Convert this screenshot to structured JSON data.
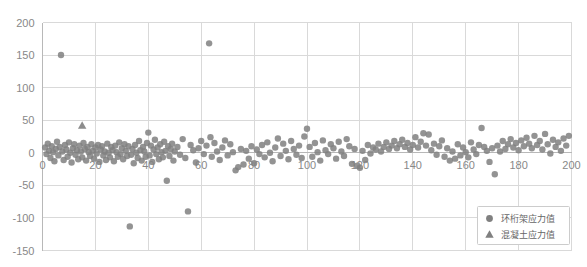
{
  "chart_data": {
    "type": "scatter",
    "title": "",
    "xlabel": "",
    "ylabel": "",
    "xlim": [
      0,
      200
    ],
    "ylim": [
      -150,
      200
    ],
    "grid": true,
    "legend_position": "bottom-right",
    "xticks": [
      "0",
      "20",
      "40",
      "60",
      "80",
      "100",
      "120",
      "140",
      "160",
      "180",
      "200"
    ],
    "xtick_values": [
      0,
      20,
      40,
      60,
      80,
      100,
      120,
      140,
      160,
      180,
      200
    ],
    "yticks": [
      "200",
      "150",
      "100",
      "50",
      "0",
      "-50",
      "-100",
      "-150"
    ],
    "ytick_values": [
      200,
      150,
      100,
      50,
      0,
      -50,
      -100,
      -150
    ],
    "marker_color": "#808080",
    "series": [
      {
        "name": "环桁架应力值",
        "marker": "circle",
        "color": "#808080",
        "points": [
          [
            1,
            8
          ],
          [
            1.5,
            -2
          ],
          [
            2,
            14
          ],
          [
            2.5,
            3
          ],
          [
            3,
            -8
          ],
          [
            3.5,
            10
          ],
          [
            4,
            1
          ],
          [
            4.5,
            -13
          ],
          [
            5,
            6
          ],
          [
            5.5,
            17
          ],
          [
            6,
            -4
          ],
          [
            6.5,
            9
          ],
          [
            7,
            150
          ],
          [
            7.5,
            2
          ],
          [
            8,
            -11
          ],
          [
            8.5,
            12
          ],
          [
            9,
            5
          ],
          [
            9.5,
            -6
          ],
          [
            10,
            16
          ],
          [
            10.5,
            0
          ],
          [
            11,
            -15
          ],
          [
            11.5,
            7
          ],
          [
            12,
            13
          ],
          [
            12.5,
            -3
          ],
          [
            13,
            4
          ],
          [
            13.5,
            -10
          ],
          [
            14,
            11
          ],
          [
            14.5,
            2
          ],
          [
            15,
            -7
          ],
          [
            15.5,
            15
          ],
          [
            16,
            6
          ],
          [
            16.5,
            -12
          ],
          [
            17,
            9
          ],
          [
            17.5,
            1
          ],
          [
            18,
            -5
          ],
          [
            18.5,
            13
          ],
          [
            19,
            3
          ],
          [
            19.5,
            -9
          ],
          [
            20,
            8
          ],
          [
            20.5,
            -1
          ],
          [
            21,
            12
          ],
          [
            21.5,
            -14
          ],
          [
            22,
            5
          ],
          [
            22.5,
            10
          ],
          [
            23,
            -4
          ],
          [
            23.5,
            2
          ],
          [
            24,
            -11
          ],
          [
            24.5,
            14
          ],
          [
            25,
            0
          ],
          [
            25.5,
            -7
          ],
          [
            26,
            9
          ],
          [
            26.5,
            4
          ],
          [
            27,
            -13
          ],
          [
            27.5,
            11
          ],
          [
            28,
            1
          ],
          [
            28.5,
            -6
          ],
          [
            29,
            16
          ],
          [
            29.5,
            -2
          ],
          [
            30,
            7
          ],
          [
            30.5,
            -10
          ],
          [
            31,
            13
          ],
          [
            31.5,
            3
          ],
          [
            32,
            -5
          ],
          [
            32.5,
            10
          ],
          [
            33,
            -113
          ],
          [
            33.5,
            -3
          ],
          [
            34,
            6
          ],
          [
            34.5,
            -16
          ],
          [
            35,
            12
          ],
          [
            35.5,
            0
          ],
          [
            36,
            -8
          ],
          [
            36.5,
            18
          ],
          [
            37,
            4
          ],
          [
            37.5,
            -12
          ],
          [
            38,
            9
          ],
          [
            38.5,
            2
          ],
          [
            39,
            -6
          ],
          [
            39.5,
            15
          ],
          [
            40,
            31
          ],
          [
            40.5,
            -4
          ],
          [
            41,
            11
          ],
          [
            41.5,
            -14
          ],
          [
            42,
            5
          ],
          [
            42.5,
            20
          ],
          [
            43,
            -2
          ],
          [
            43.5,
            8
          ],
          [
            44,
            -10
          ],
          [
            44.5,
            13
          ],
          [
            45,
            1
          ],
          [
            45.5,
            -7
          ],
          [
            46,
            17
          ],
          [
            46.5,
            3
          ],
          [
            47,
            -43
          ],
          [
            47.5,
            10
          ],
          [
            48,
            -5
          ],
          [
            48.5,
            6
          ],
          [
            49,
            14
          ],
          [
            49.5,
            -12
          ],
          [
            50,
            2
          ],
          [
            51,
            9
          ],
          [
            52,
            -3
          ],
          [
            53,
            21
          ],
          [
            54,
            -8
          ],
          [
            55,
            -90
          ],
          [
            56,
            12
          ],
          [
            57,
            4
          ],
          [
            58,
            -15
          ],
          [
            59,
            7
          ],
          [
            60,
            18
          ],
          [
            61,
            -2
          ],
          [
            62,
            11
          ],
          [
            63,
            168
          ],
          [
            63.5,
            24
          ],
          [
            64,
            -6
          ],
          [
            65,
            15
          ],
          [
            66,
            2
          ],
          [
            67,
            -11
          ],
          [
            68,
            8
          ],
          [
            69,
            19
          ],
          [
            70,
            -4
          ],
          [
            71,
            13
          ],
          [
            72,
            1
          ],
          [
            73,
            -27
          ],
          [
            74,
            -22
          ],
          [
            75,
            6
          ],
          [
            76,
            -18
          ],
          [
            77,
            3
          ],
          [
            78,
            -9
          ],
          [
            79,
            10
          ],
          [
            80,
            -16
          ],
          [
            81,
            5
          ],
          [
            82,
            -2
          ],
          [
            83,
            12
          ],
          [
            84,
            -7
          ],
          [
            85,
            16
          ],
          [
            86,
            0
          ],
          [
            87,
            -13
          ],
          [
            88,
            8
          ],
          [
            89,
            22
          ],
          [
            90,
            -5
          ],
          [
            91,
            14
          ],
          [
            92,
            3
          ],
          [
            93,
            -10
          ],
          [
            94,
            18
          ],
          [
            95,
            6
          ],
          [
            96,
            -3
          ],
          [
            97,
            11
          ],
          [
            98,
            -8
          ],
          [
            99,
            25
          ],
          [
            100,
            37
          ],
          [
            101,
            9
          ],
          [
            102,
            -6
          ],
          [
            103,
            15
          ],
          [
            104,
            1
          ],
          [
            105,
            -12
          ],
          [
            106,
            19
          ],
          [
            107,
            4
          ],
          [
            108,
            -2
          ],
          [
            109,
            13
          ],
          [
            110,
            7
          ],
          [
            111,
            -9
          ],
          [
            112,
            17
          ],
          [
            113,
            2
          ],
          [
            114,
            -5
          ],
          [
            115,
            21
          ],
          [
            116,
            10
          ],
          [
            117,
            -17
          ],
          [
            118,
            6
          ],
          [
            119,
            -20
          ],
          [
            120,
            -23
          ],
          [
            121,
            3
          ],
          [
            122,
            -11
          ],
          [
            123,
            12
          ],
          [
            124,
            -1
          ],
          [
            125,
            8
          ],
          [
            126,
            5
          ],
          [
            127,
            14
          ],
          [
            128,
            2
          ],
          [
            129,
            9
          ],
          [
            130,
            16
          ],
          [
            131,
            6
          ],
          [
            132,
            11
          ],
          [
            133,
            18
          ],
          [
            134,
            7
          ],
          [
            135,
            13
          ],
          [
            136,
            20
          ],
          [
            137,
            9
          ],
          [
            138,
            15
          ],
          [
            139,
            5
          ],
          [
            140,
            12
          ],
          [
            141,
            24
          ],
          [
            142,
            8
          ],
          [
            143,
            17
          ],
          [
            144,
            30
          ],
          [
            145,
            11
          ],
          [
            146,
            28
          ],
          [
            147,
            4
          ],
          [
            148,
            14
          ],
          [
            149,
            -3
          ],
          [
            150,
            10
          ],
          [
            151,
            19
          ],
          [
            152,
            -6
          ],
          [
            153,
            7
          ],
          [
            154,
            -12
          ],
          [
            155,
            2
          ],
          [
            156,
            -9
          ],
          [
            157,
            13
          ],
          [
            158,
            -4
          ],
          [
            159,
            8
          ],
          [
            160,
            1
          ],
          [
            161,
            -7
          ],
          [
            162,
            16
          ],
          [
            163,
            5
          ],
          [
            164,
            -2
          ],
          [
            165,
            12
          ],
          [
            166,
            38
          ],
          [
            167,
            9
          ],
          [
            168,
            3
          ],
          [
            169,
            -14
          ],
          [
            170,
            7
          ],
          [
            171,
            -33
          ],
          [
            172,
            11
          ],
          [
            173,
            2
          ],
          [
            174,
            18
          ],
          [
            175,
            6
          ],
          [
            176,
            13
          ],
          [
            177,
            21
          ],
          [
            178,
            8
          ],
          [
            179,
            15
          ],
          [
            180,
            4
          ],
          [
            181,
            19
          ],
          [
            182,
            10
          ],
          [
            183,
            23
          ],
          [
            184,
            14
          ],
          [
            185,
            7
          ],
          [
            186,
            26
          ],
          [
            187,
            12
          ],
          [
            188,
            18
          ],
          [
            189,
            5
          ],
          [
            190,
            29
          ],
          [
            191,
            13
          ],
          [
            192,
            -1
          ],
          [
            193,
            20
          ],
          [
            194,
            9
          ],
          [
            195,
            16
          ],
          [
            196,
            3
          ],
          [
            197,
            22
          ],
          [
            198,
            11
          ],
          [
            199,
            26
          ]
        ]
      },
      {
        "name": "混凝土应力值",
        "marker": "triangle",
        "color": "#808080",
        "points": [
          [
            15,
            42
          ]
        ]
      }
    ]
  },
  "legend": {
    "items": [
      {
        "label": "环桁架应力值",
        "marker": "circle"
      },
      {
        "label": "混凝土应力值",
        "marker": "triangle"
      }
    ]
  }
}
